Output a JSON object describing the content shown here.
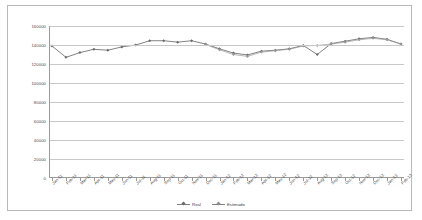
{
  "chart_data": {
    "type": "line",
    "title": "",
    "xlabel": "",
    "ylabel": "",
    "ylim": [
      0,
      160000
    ],
    "ytick_values": [
      0,
      20000,
      40000,
      60000,
      80000,
      100000,
      120000,
      140000,
      160000
    ],
    "ytick_labels": [
      "0",
      "20000",
      "40000",
      "60000",
      "80000",
      "100000",
      "120000",
      "140000",
      "160000"
    ],
    "grid": true,
    "legend_position": "bottom-center",
    "categories": [
      "Jan-11",
      "Feb-11",
      "Mar-11",
      "Apr-11",
      "May-11",
      "Jun-11",
      "Jul-11",
      "Aug-11",
      "Sep-11",
      "Oct-11",
      "Nov-11",
      "Dec-11",
      "Jan-12",
      "Feb-12",
      "Mar-12",
      "Apr-12",
      "May-12",
      "Jun-12",
      "Jul-12",
      "Aug-12",
      "Sep-12",
      "Oct-12",
      "Nov-12",
      "Dec-12",
      "Jan-13",
      "Feb-13"
    ],
    "series": [
      {
        "name": "Real",
        "color": "#6b6b6b",
        "values": [
          139000,
          127000,
          132000,
          135500,
          134500,
          138000,
          140000,
          144500,
          144500,
          143000,
          144500,
          141000,
          136000,
          131500,
          129500,
          133500,
          134500,
          136000,
          139500,
          130000,
          141500,
          144000,
          146500,
          148000,
          146000,
          141000
        ]
      },
      {
        "name": "Estimado",
        "color": "#9a9a9a",
        "values": [
          null,
          null,
          null,
          null,
          null,
          null,
          null,
          null,
          null,
          null,
          null,
          140500,
          135000,
          130000,
          128000,
          132500,
          134000,
          135500,
          139000,
          139500,
          141000,
          143000,
          145500,
          147000,
          145500,
          141000
        ]
      }
    ]
  },
  "legend": {
    "items": [
      {
        "label": "Real"
      },
      {
        "label": "Estimado"
      }
    ]
  }
}
